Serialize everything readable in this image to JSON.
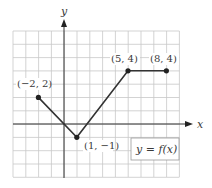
{
  "chart_data": {
    "type": "line",
    "title": "",
    "xlabel": "x",
    "ylabel": "y",
    "xlim": [
      -4,
      9
    ],
    "ylim": [
      -4,
      7
    ],
    "grid": true,
    "series": [
      {
        "name": "y = f(x)",
        "x": [
          -2,
          1,
          5,
          8
        ],
        "y": [
          2,
          -1,
          4,
          4
        ]
      }
    ],
    "annotations": [
      {
        "text": "(−2, 2)",
        "x": -2,
        "y": 2
      },
      {
        "text": "(1, −1)",
        "x": 1,
        "y": -1
      },
      {
        "text": "(5, 4)",
        "x": 5,
        "y": 4
      },
      {
        "text": "(8, 4)",
        "x": 8,
        "y": 4
      }
    ],
    "legend": {
      "text": "y = f(x)",
      "position": "lower right"
    }
  },
  "labels": {
    "x_axis": "x",
    "y_axis": "y",
    "p1": "(−2, 2)",
    "p2": "(1, −1)",
    "p3": "(5, 4)",
    "p4": "(8, 4)",
    "legend": "y = f(x)"
  },
  "colors": {
    "grid": "#c8c8c8",
    "axis": "#333333",
    "line": "#333333"
  }
}
